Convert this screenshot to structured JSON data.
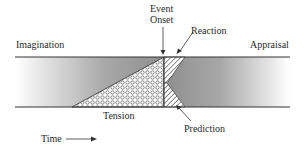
{
  "labels": {
    "imagination": "Imagination",
    "appraisal": "Appraisal",
    "event_onset_line1": "Event",
    "event_onset_line2": "Onset",
    "reaction": "Reaction",
    "tension": "Tension",
    "prediction": "Prediction",
    "time": "Time"
  },
  "colors": {
    "band_dark": "#8f8f8f",
    "band_light": "#ffffff",
    "line": "#333333",
    "tension_fill": "#ffffff",
    "hatch": "#444444"
  }
}
